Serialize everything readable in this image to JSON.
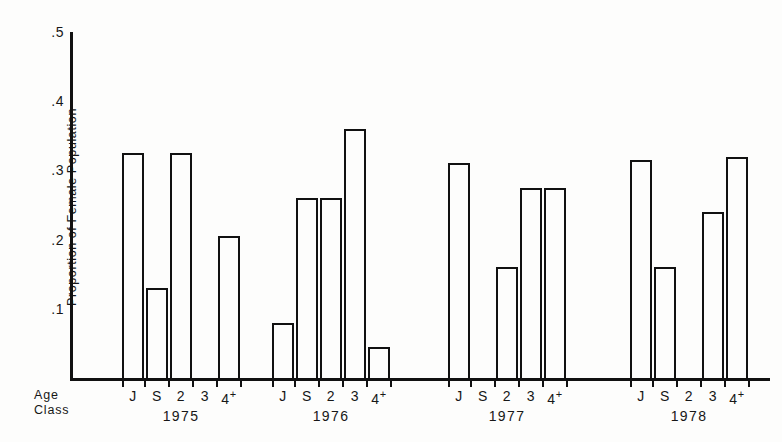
{
  "chart_data": {
    "type": "bar",
    "title": "",
    "xlabel": "Age Class",
    "ylabel": "Proportion of Female Population",
    "ylim": [
      0,
      0.5
    ],
    "yticks": [
      ".5",
      ".4",
      ".3",
      ".2",
      ".1"
    ],
    "ytick_values": [
      0.5,
      0.4,
      0.3,
      0.2,
      0.1
    ],
    "grid": false,
    "legend": false,
    "age_classes": [
      "J",
      "S",
      "2",
      "3",
      "4+"
    ],
    "groups": [
      {
        "year": "1975",
        "categories": [
          "J",
          "S",
          "2",
          "3",
          "4+"
        ],
        "values": [
          0.325,
          0.13,
          0.325,
          0.0,
          0.205
        ]
      },
      {
        "year": "1976",
        "categories": [
          "J",
          "S",
          "2",
          "3",
          "4+"
        ],
        "values": [
          0.08,
          0.26,
          0.26,
          0.36,
          0.045
        ]
      },
      {
        "year": "1977",
        "categories": [
          "J",
          "S",
          "2",
          "3",
          "4+"
        ],
        "values": [
          0.31,
          0.0,
          0.16,
          0.275,
          0.275
        ]
      },
      {
        "year": "1978",
        "categories": [
          "J",
          "S",
          "2",
          "3",
          "4+"
        ],
        "values": [
          0.315,
          0.16,
          0.0,
          0.24,
          0.32
        ]
      }
    ]
  },
  "axis": {
    "y_title": "Proportion of Female Population",
    "x_title_line1": "Age",
    "x_title_line2": "Class"
  }
}
